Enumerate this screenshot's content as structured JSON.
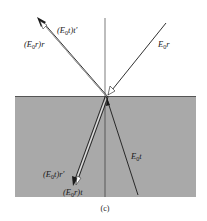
{
  "figure": {
    "caption": "(c)",
    "colors": {
      "medium": "#a9a9a9",
      "medium_edge": "#555555",
      "ray": "#1a1a1a",
      "background": "#ffffff"
    },
    "interface_y": 96,
    "normal_x": 105,
    "point_of_incidence": [
      106,
      96
    ]
  },
  "labels": {
    "incident": {
      "prefix": "E",
      "sub": "0",
      "suffix": "r"
    },
    "top_inner": {
      "open": "(E",
      "sub": "0",
      "suffix": "t)t′"
    },
    "top_outer": {
      "open": "(E",
      "sub": "0",
      "suffix": "r)r"
    },
    "transmitted": {
      "prefix": "E",
      "sub": "0",
      "suffix": "t"
    },
    "bottom_inner": {
      "open": "(E",
      "sub": "0",
      "suffix": "t)r′"
    },
    "bottom_outer": {
      "open": "(E",
      "sub": "0",
      "suffix": "r)t"
    }
  },
  "rays": [
    {
      "name": "incident-ray",
      "from": [
        166,
        23
      ],
      "to": [
        108,
        95
      ]
    },
    {
      "name": "reflected-ray-outer",
      "from": [
        106,
        96
      ],
      "to": [
        38,
        19
      ]
    },
    {
      "name": "reflected-ray-inner",
      "from": [
        106,
        98
      ],
      "to": [
        40,
        21
      ]
    },
    {
      "name": "transmitted-ray-outer",
      "from": [
        105,
        97
      ],
      "to": [
        74,
        184
      ]
    },
    {
      "name": "transmitted-ray-inner",
      "from": [
        107,
        97
      ],
      "to": [
        77,
        185
      ]
    },
    {
      "name": "refracted-ray",
      "from": [
        106,
        96
      ],
      "to": [
        138,
        195
      ]
    }
  ]
}
